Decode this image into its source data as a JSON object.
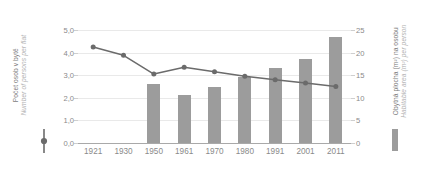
{
  "chart_data": {
    "type": "bar",
    "title": "",
    "subtitle": "",
    "xlabel": "",
    "categories": [
      "1921",
      "1930",
      "1950",
      "1961",
      "1970",
      "1980",
      "1991",
      "2001",
      "2011"
    ],
    "grid": true,
    "legend_position": "axis-titles",
    "axes": {
      "left": {
        "label_cs": "Počet osob v bytě",
        "label_en": "Number of persons per flat",
        "ylim": [
          0.0,
          5.0
        ],
        "ticks": [
          "0,0",
          "1,0",
          "2,0",
          "3,0",
          "4,0",
          "5,0"
        ],
        "tick_values": [
          0.0,
          1.0,
          2.0,
          3.0,
          4.0,
          5.0
        ]
      },
      "right": {
        "label_cs": "Obytná plocha (m²) na osobu",
        "label_en": "Habitable area (m²) per person",
        "ylim": [
          0,
          25
        ],
        "ticks": [
          "0",
          "5",
          "10",
          "15",
          "20",
          "25"
        ],
        "tick_values": [
          0,
          5,
          10,
          15,
          20,
          25
        ]
      }
    },
    "series": [
      {
        "name": "Počet osob v bytě",
        "name_en": "Number of persons per flat",
        "type": "line",
        "axis": "left",
        "color": "#6b6b6b",
        "marker": "circle",
        "values": [
          4.25,
          3.88,
          3.05,
          3.35,
          3.15,
          2.95,
          2.8,
          2.65,
          2.5
        ]
      },
      {
        "name": "Obytná plocha (m²) na osobu",
        "name_en": "Habitable area (m²) per person",
        "type": "bar",
        "axis": "right",
        "color": "#9c9c9c",
        "values": [
          null,
          null,
          13.1,
          10.7,
          12.5,
          14.7,
          16.6,
          18.6,
          23.5
        ]
      }
    ]
  },
  "colors": {
    "bar": "#9c9c9c",
    "line": "#6b6b6b",
    "grid": "#e9e9e9",
    "baseline": "#a9a9a9",
    "tick_text": "#8a8a8a",
    "title_primary": "#7d7d7d",
    "title_secondary": "#b3b3b3",
    "background": "#ffffff"
  }
}
